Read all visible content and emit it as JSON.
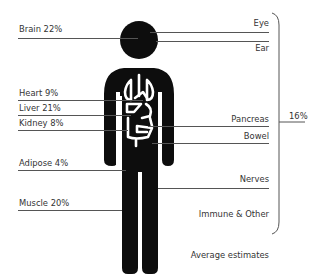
{
  "left_labels": [
    {
      "label": "Brain 22%",
      "y": 28
    },
    {
      "label": "Heart 9%",
      "y": 92
    },
    {
      "label": "Liver 21%",
      "y": 107
    },
    {
      "label": "Kidney 8%",
      "y": 122
    },
    {
      "label": "Adipose 4%",
      "y": 162
    },
    {
      "label": "Muscle 20%",
      "y": 202
    }
  ],
  "right_labels": [
    {
      "label": "Eye",
      "y": 22
    },
    {
      "label": "Ear",
      "y": 47
    },
    {
      "label": "Pancreas",
      "y": 118
    },
    {
      "label": "Bowel",
      "y": 135
    },
    {
      "label": "Nerves",
      "y": 178
    },
    {
      "label": "Immune & Other",
      "y": 213
    }
  ],
  "bracket_total": "16%",
  "footnote": "Average estimates",
  "colors": {
    "figure": "#0d0d0d",
    "organs": "#ffffff",
    "lines": "#555555",
    "text": "#333333"
  }
}
